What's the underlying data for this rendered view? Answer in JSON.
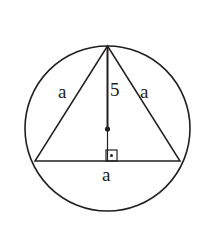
{
  "figure": {
    "kind": "geometry-diagram",
    "background_color": "#ffffff",
    "stroke_color": "#231f20",
    "circle": {
      "name": "circumscribed-circle",
      "center_x": 107.5,
      "center_y": 128.5,
      "radius": 82.5,
      "stroke_width": 1.6
    },
    "triangle": {
      "name": "inscribed-triangle",
      "apex_x": 107.5,
      "apex_y": 46,
      "left_x": 35,
      "left_y": 161,
      "right_x": 180,
      "right_y": 161,
      "stroke_width": 1.5
    },
    "altitude": {
      "name": "altitude-segment",
      "x": 107.5,
      "top_y": 46,
      "center_y": 129,
      "bottom_y": 161,
      "stroke_width": 1.8
    },
    "center_dot": {
      "name": "circle-center-point",
      "x": 107.5,
      "y": 129,
      "radius": 2.6
    },
    "right_angle": {
      "name": "right-angle-marker",
      "x": 106,
      "y": 150,
      "size": 11,
      "dot_radius": 1.5
    }
  },
  "labels": {
    "side_left": "a",
    "altitude": "5",
    "side_right": "a",
    "base": "a"
  }
}
